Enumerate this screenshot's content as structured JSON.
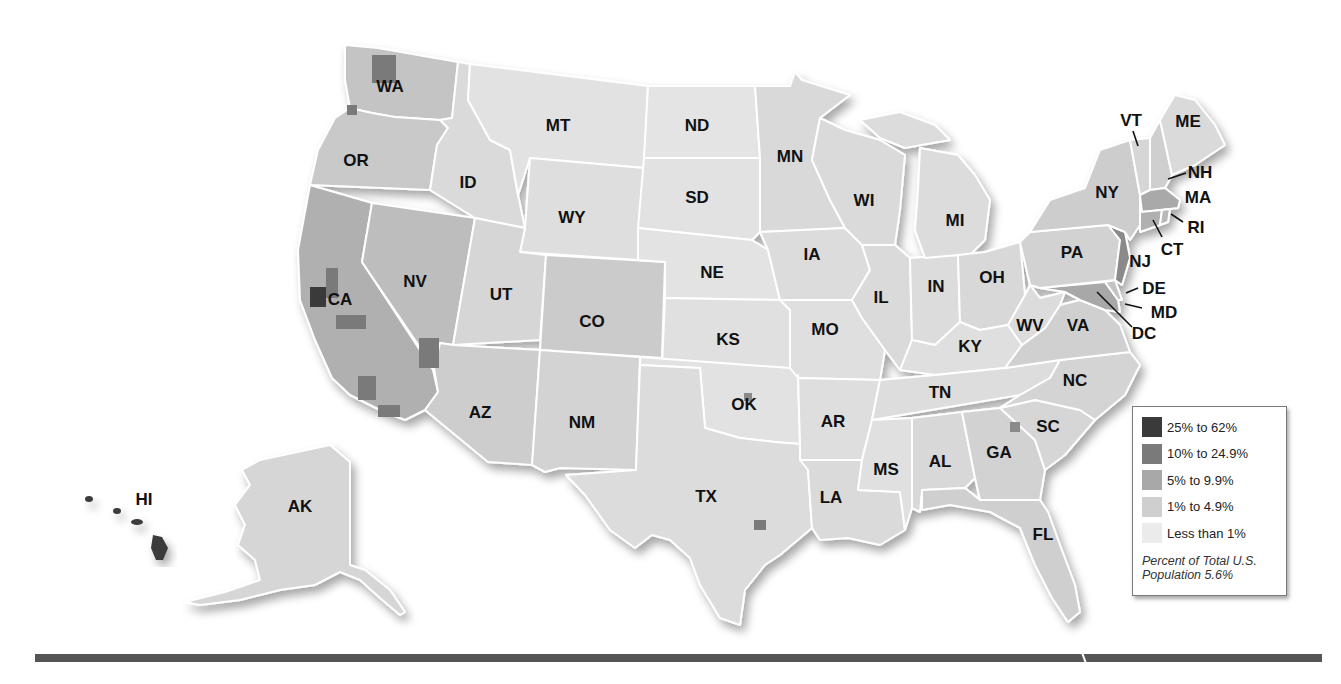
{
  "map": {
    "title": "",
    "subject": "Percent of county population by category, United States",
    "colors": {
      "background": "#ffffff",
      "border": "#ffffff",
      "label": "#111111",
      "bin_25_62": "#3a3a3a",
      "bin_10_249": "#7a7a7a",
      "bin_5_99": "#a8a8a8",
      "bin_1_49": "#cfcfcf",
      "bin_lt1": "#ebebeb"
    },
    "state_labels": [
      {
        "abbr": "WA",
        "x": 390,
        "y": 92
      },
      {
        "abbr": "OR",
        "x": 356,
        "y": 166
      },
      {
        "abbr": "CA",
        "x": 340,
        "y": 305
      },
      {
        "abbr": "NV",
        "x": 415,
        "y": 287
      },
      {
        "abbr": "ID",
        "x": 468,
        "y": 188
      },
      {
        "abbr": "MT",
        "x": 558,
        "y": 131
      },
      {
        "abbr": "WY",
        "x": 572,
        "y": 223
      },
      {
        "abbr": "UT",
        "x": 501,
        "y": 300
      },
      {
        "abbr": "AZ",
        "x": 480,
        "y": 418
      },
      {
        "abbr": "CO",
        "x": 592,
        "y": 327
      },
      {
        "abbr": "NM",
        "x": 582,
        "y": 428
      },
      {
        "abbr": "ND",
        "x": 697,
        "y": 131
      },
      {
        "abbr": "SD",
        "x": 697,
        "y": 203
      },
      {
        "abbr": "NE",
        "x": 712,
        "y": 278
      },
      {
        "abbr": "KS",
        "x": 728,
        "y": 345
      },
      {
        "abbr": "OK",
        "x": 744,
        "y": 410
      },
      {
        "abbr": "TX",
        "x": 706,
        "y": 502
      },
      {
        "abbr": "MN",
        "x": 790,
        "y": 162
      },
      {
        "abbr": "IA",
        "x": 812,
        "y": 260
      },
      {
        "abbr": "MO",
        "x": 825,
        "y": 335
      },
      {
        "abbr": "AR",
        "x": 833,
        "y": 427
      },
      {
        "abbr": "LA",
        "x": 831,
        "y": 503
      },
      {
        "abbr": "WI",
        "x": 864,
        "y": 206
      },
      {
        "abbr": "IL",
        "x": 881,
        "y": 303
      },
      {
        "abbr": "MI",
        "x": 955,
        "y": 226
      },
      {
        "abbr": "IN",
        "x": 936,
        "y": 292
      },
      {
        "abbr": "OH",
        "x": 992,
        "y": 283
      },
      {
        "abbr": "KY",
        "x": 970,
        "y": 352
      },
      {
        "abbr": "TN",
        "x": 940,
        "y": 398
      },
      {
        "abbr": "MS",
        "x": 886,
        "y": 475
      },
      {
        "abbr": "AL",
        "x": 940,
        "y": 467
      },
      {
        "abbr": "GA",
        "x": 999,
        "y": 458
      },
      {
        "abbr": "FL",
        "x": 1043,
        "y": 540
      },
      {
        "abbr": "SC",
        "x": 1048,
        "y": 432
      },
      {
        "abbr": "NC",
        "x": 1075,
        "y": 386
      },
      {
        "abbr": "VA",
        "x": 1078,
        "y": 331
      },
      {
        "abbr": "WV",
        "x": 1030,
        "y": 331
      },
      {
        "abbr": "PA",
        "x": 1072,
        "y": 258
      },
      {
        "abbr": "NY",
        "x": 1107,
        "y": 198
      },
      {
        "abbr": "NJ",
        "x": 1140,
        "y": 267
      },
      {
        "abbr": "VT",
        "x": 1131,
        "y": 126
      },
      {
        "abbr": "ME",
        "x": 1188,
        "y": 127
      },
      {
        "abbr": "NH",
        "x": 1200,
        "y": 178
      },
      {
        "abbr": "MA",
        "x": 1198,
        "y": 203
      },
      {
        "abbr": "RI",
        "x": 1196,
        "y": 233
      },
      {
        "abbr": "CT",
        "x": 1172,
        "y": 255
      },
      {
        "abbr": "DE",
        "x": 1154,
        "y": 294
      },
      {
        "abbr": "MD",
        "x": 1164,
        "y": 318
      },
      {
        "abbr": "DC",
        "x": 1144,
        "y": 339
      },
      {
        "abbr": "AK",
        "x": 300,
        "y": 512
      },
      {
        "abbr": "HI",
        "x": 144,
        "y": 505
      }
    ]
  },
  "legend": {
    "items": [
      {
        "label": "25% to 62%",
        "color": "#3a3a3a"
      },
      {
        "label": "10% to 24.9%",
        "color": "#7a7a7a"
      },
      {
        "label": "5% to 9.9%",
        "color": "#a8a8a8"
      },
      {
        "label": "1% to 4.9%",
        "color": "#cfcfcf"
      },
      {
        "label": "Less than 1%",
        "color": "#ebebeb"
      }
    ],
    "note_line1": "Percent of Total U.S.",
    "note_line2": "Population 5.6%"
  }
}
